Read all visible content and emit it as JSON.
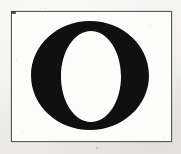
{
  "specimen": {
    "glyph": "O",
    "glyph_name": "capital-letter-o",
    "script": "Latin",
    "case": "uppercase",
    "style_description": "High-contrast Didone serif capital O",
    "caption": ""
  },
  "canvas": {
    "width_px": 181,
    "height_px": 154,
    "paper_color": "#f2f1ef",
    "plate_color": "#fdfdfc"
  },
  "rule_box": {
    "left_px": 11,
    "top_px": 11,
    "width_px": 161,
    "height_px": 131,
    "stroke_color": "#57565b",
    "stroke_width_px": 1
  },
  "letterform": {
    "ink_color": "#101010",
    "counter_color": "#ffffff",
    "outer_left_px": 31,
    "outer_top_px": 21,
    "outer_width_px": 118,
    "outer_height_px": 109,
    "counter_left_px": 62,
    "counter_top_px": 30,
    "counter_width_px": 60,
    "counter_height_px": 91,
    "stroke_contrast": "high",
    "thick_stroke_axis": "vertical",
    "thin_stroke_axis": "horizontal"
  },
  "speckles": [
    {
      "x": 22,
      "y": 132,
      "size": 1.4
    },
    {
      "x": 150,
      "y": 25,
      "size": 1.2
    },
    {
      "x": 163,
      "y": 137,
      "size": 1.3
    },
    {
      "x": 16,
      "y": 60,
      "size": 1.0
    },
    {
      "x": 96,
      "y": 147,
      "size": 1.5
    },
    {
      "x": 45,
      "y": 8,
      "size": 1.1
    },
    {
      "x": 128,
      "y": 150,
      "size": 1.2
    }
  ]
}
